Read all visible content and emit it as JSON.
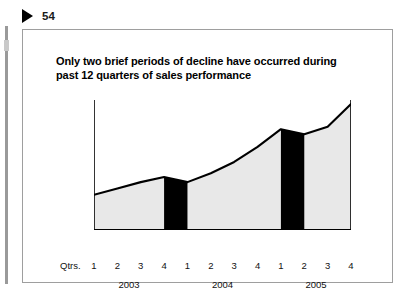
{
  "slide": {
    "number": "54",
    "bullet_icon": "triangle-right-icon",
    "title": "Only two brief periods of decline have occurred during past 12 quarters of sales performance"
  },
  "axis": {
    "qtrs_caption": "Qtrs.",
    "quarter_labels": [
      "1",
      "2",
      "3",
      "4",
      "1",
      "2",
      "3",
      "4",
      "1",
      "2",
      "3",
      "4"
    ],
    "year_labels": [
      "2003",
      "2004",
      "2005"
    ]
  },
  "colors": {
    "area_fill": "#e8e8e8",
    "line": "#000000",
    "highlight_band": "#000000",
    "frame_border": "#9e9e9e",
    "text": "#000000"
  },
  "chart_data": {
    "type": "area",
    "title": "Only two brief periods of decline have occurred during past 12 quarters of sales performance",
    "xlabel": "Qtrs.",
    "ylabel": "",
    "grid": false,
    "legend": "none",
    "categories": [
      "2003 Q1",
      "2003 Q2",
      "2003 Q3",
      "2003 Q4",
      "2004 Q1",
      "2004 Q2",
      "2004 Q3",
      "2004 Q4",
      "2005 Q1",
      "2005 Q2",
      "2005 Q3",
      "2005 Q4"
    ],
    "x": [
      1,
      2,
      3,
      4,
      5,
      6,
      7,
      8,
      9,
      10,
      11,
      12
    ],
    "values": [
      28,
      33,
      38,
      42,
      38,
      45,
      54,
      66,
      80,
      76,
      82,
      100
    ],
    "ylim": [
      0,
      100
    ],
    "series": [
      {
        "name": "Sales performance",
        "values": [
          28,
          33,
          38,
          42,
          38,
          45,
          54,
          66,
          80,
          76,
          82,
          100
        ]
      }
    ],
    "annotations": [
      {
        "label": "decline period 1",
        "from": "2003 Q4",
        "to": "2004 Q1",
        "style": "black-band"
      },
      {
        "label": "decline period 2",
        "from": "2005 Q1",
        "to": "2005 Q2",
        "style": "black-band"
      }
    ]
  }
}
